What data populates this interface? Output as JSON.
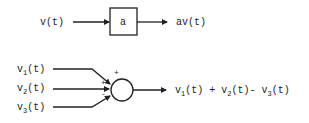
{
  "diagram": {
    "gain_block": {
      "input_label": "v(t)",
      "gain_label": "a",
      "output_label": "av(t)"
    },
    "summer": {
      "inputs": [
        {
          "base": "v",
          "sub": "1",
          "suffix": "(t)",
          "sign": "+"
        },
        {
          "base": "v",
          "sub": "2",
          "suffix": "(t)",
          "sign": "+"
        },
        {
          "base": "v",
          "sub": "3",
          "suffix": "(t)",
          "sign": "-"
        }
      ],
      "output": {
        "t1_base": "v",
        "t1_sub": "1",
        "t1_suffix": "(t)",
        "op1": "+",
        "t2_base": "v",
        "t2_sub": "2",
        "t2_suffix": "(t)",
        "op2": "-",
        "t3_base": "v",
        "t3_sub": "3",
        "t3_suffix": "(t)"
      }
    }
  }
}
